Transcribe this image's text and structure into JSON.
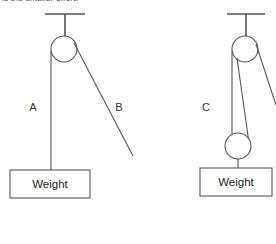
{
  "prompt": {
    "text": "is the smaller effort."
  },
  "canvas": {
    "width": 276,
    "height": 244,
    "background": "#ffffff",
    "stroke": "#555555"
  },
  "figures": [
    {
      "id": "single-fixed-pulley",
      "name": "Single fixed pulley system",
      "ceiling_bracket": {
        "x1": 45,
        "y1": 14,
        "x2": 85,
        "y2": 14,
        "stem_x": 65,
        "stem_y1": 14,
        "stem_y2": 40
      },
      "pulley": {
        "cx": 64,
        "cy": 49,
        "r": 13
      },
      "ropes": [
        {
          "label": "A",
          "label_x": 33,
          "label_y": 108,
          "x1": 51,
          "y1": 51,
          "x2": 51,
          "y2": 171,
          "kind": "load-side"
        },
        {
          "label": "B",
          "label_x": 119,
          "label_y": 108,
          "x1": 74,
          "y1": 43,
          "x2": 133,
          "y2": 156,
          "kind": "effort-side"
        }
      ],
      "weight_box": {
        "x": 10,
        "y": 170,
        "width": 80,
        "height": 28,
        "label": "Weight"
      }
    },
    {
      "id": "compound-pulley",
      "name": "Compound pulley system with movable pulley",
      "ceiling_bracket": {
        "x1": 227,
        "y1": 14,
        "x2": 265,
        "y2": 14,
        "stem_x": 246,
        "stem_y1": 14,
        "stem_y2": 40
      },
      "fixed_pulley": {
        "cx": 245,
        "cy": 49,
        "r": 13
      },
      "movable_pulley": {
        "cx": 238,
        "cy": 146,
        "r": 13
      },
      "ropes": [
        {
          "label": "C",
          "label_x": 206,
          "label_y": 108,
          "x1": 232,
          "y1": 51,
          "x2": 232,
          "y2": 146,
          "kind": "load-side"
        },
        {
          "label": "",
          "label_x": 0,
          "label_y": 0,
          "x1": 237,
          "y1": 58,
          "x2": 249,
          "y2": 143,
          "kind": "movable-wrap"
        },
        {
          "label": "",
          "label_x": 0,
          "label_y": 0,
          "x1": 256,
          "y1": 44,
          "x2": 276,
          "y2": 105,
          "kind": "effort-side"
        }
      ],
      "hanger": {
        "x": 238,
        "y1": 159,
        "y2": 168
      },
      "weight_box": {
        "x": 200,
        "y": 168,
        "width": 72,
        "height": 28,
        "label": "Weight"
      }
    }
  ]
}
